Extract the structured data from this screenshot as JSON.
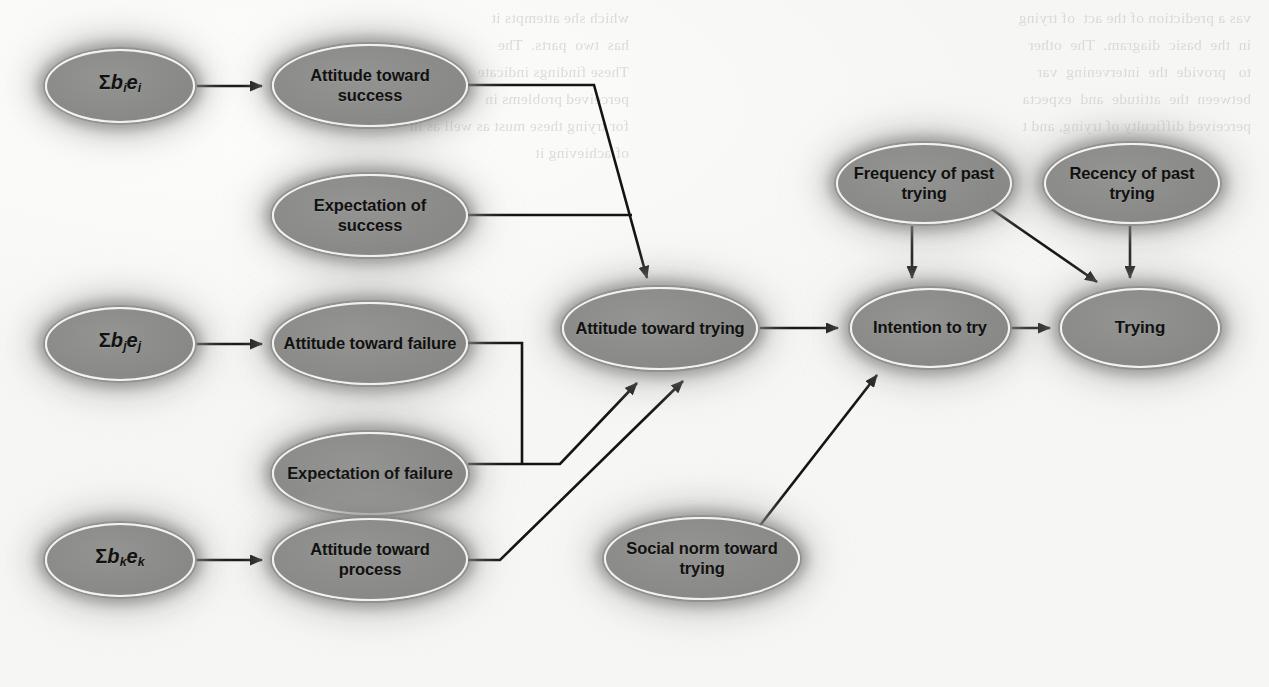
{
  "figure": {
    "kind": "path-diagram",
    "background_note": "scanned book page with faint mirrored bleed-through text from reverse side"
  },
  "background_bleed_text": {
    "left_column": "vas a prediction of the act  of trying\nin  the  basic  diagram.  The  other\nto   provide  the  intervening  var\nbetween  the  attitude  and  expecta\nperceived difficulty of trying, and t",
    "right_column": "which she attempts it\nhas  two  parts.  The\nThese findings indicate\nperceived problems in\nfor trying these must as well as in\nof achieving it"
  },
  "nodes": [
    {
      "id": "sum_i",
      "label_html": "Σ<i>b</i><sub>i</sub><i>e</i><sub>i</sub>",
      "kind": "math",
      "x": 45,
      "y": 49,
      "w": 150,
      "h": 74
    },
    {
      "id": "att_success",
      "label": "Attitude toward success",
      "kind": "two-line",
      "x": 272,
      "y": 44,
      "w": 196,
      "h": 83
    },
    {
      "id": "exp_success",
      "label": "Expectation of success",
      "kind": "two-line",
      "x": 272,
      "y": 174,
      "w": 196,
      "h": 83
    },
    {
      "id": "sum_j",
      "label_html": "Σ<i>b</i><sub>j</sub><i>e</i><sub>j</sub>",
      "kind": "math",
      "x": 45,
      "y": 307,
      "w": 150,
      "h": 74
    },
    {
      "id": "att_failure",
      "label": "Attitude toward failure",
      "kind": "two-line",
      "x": 272,
      "y": 302,
      "w": 196,
      "h": 83
    },
    {
      "id": "exp_failure",
      "label": "Expectation of failure",
      "kind": "two-line",
      "x": 272,
      "y": 432,
      "w": 196,
      "h": 83
    },
    {
      "id": "sum_k",
      "label_html": "Σ<i>b</i><sub>k</sub><i>e</i><sub>k</sub>",
      "kind": "math",
      "x": 45,
      "y": 523,
      "w": 150,
      "h": 74
    },
    {
      "id": "att_process",
      "label": "Attitude toward process",
      "kind": "two-line",
      "x": 272,
      "y": 518,
      "w": 196,
      "h": 83
    },
    {
      "id": "att_trying",
      "label": "Attitude toward trying",
      "kind": "two-line",
      "x": 562,
      "y": 287,
      "w": 196,
      "h": 83
    },
    {
      "id": "social_norm",
      "label": "Social norm toward trying",
      "kind": "two-line",
      "x": 604,
      "y": 517,
      "w": 196,
      "h": 83
    },
    {
      "id": "freq_past",
      "label": "Frequency of past trying",
      "kind": "two-line",
      "x": 836,
      "y": 143,
      "w": 176,
      "h": 81
    },
    {
      "id": "recency_past",
      "label": "Recency of past trying",
      "kind": "two-line",
      "x": 1044,
      "y": 143,
      "w": 176,
      "h": 81
    },
    {
      "id": "intention",
      "label": "Intention to try",
      "kind": "two-line",
      "x": 850,
      "y": 288,
      "w": 160,
      "h": 80
    },
    {
      "id": "trying",
      "label": "Trying",
      "kind": "single",
      "x": 1060,
      "y": 288,
      "w": 160,
      "h": 80
    }
  ],
  "edges": [
    {
      "from": "sum_i",
      "to": "att_success",
      "style": "straight-arrow"
    },
    {
      "from": "sum_j",
      "to": "att_failure",
      "style": "straight-arrow"
    },
    {
      "from": "sum_k",
      "to": "att_process",
      "style": "straight-arrow"
    },
    {
      "from": "att_success",
      "to": "att_trying",
      "style": "orthogonal-merge-arrow"
    },
    {
      "from": "exp_success",
      "to": "att_trying",
      "style": "orthogonal-merge-arrow"
    },
    {
      "from": "att_failure",
      "to": "att_trying",
      "style": "orthogonal-merge-arrow"
    },
    {
      "from": "exp_failure",
      "to": "att_trying",
      "style": "orthogonal-merge-arrow"
    },
    {
      "from": "att_process",
      "to": "att_trying",
      "style": "elbow-diagonal-arrow"
    },
    {
      "from": "att_trying",
      "to": "intention",
      "style": "straight-arrow"
    },
    {
      "from": "social_norm",
      "to": "intention",
      "style": "diagonal-arrow"
    },
    {
      "from": "freq_past",
      "to": "intention",
      "style": "straight-arrow"
    },
    {
      "from": "freq_past",
      "to": "trying",
      "style": "diagonal-arrow"
    },
    {
      "from": "recency_past",
      "to": "trying",
      "style": "straight-arrow"
    },
    {
      "from": "intention",
      "to": "trying",
      "style": "straight-arrow"
    }
  ],
  "colors": {
    "node_fill": "#8b8b89",
    "node_border": "#f2f2ee",
    "node_text": "#111110",
    "edge": "#141412",
    "page": "#fbfbfa",
    "bleed_text": "#c9c9c6"
  }
}
